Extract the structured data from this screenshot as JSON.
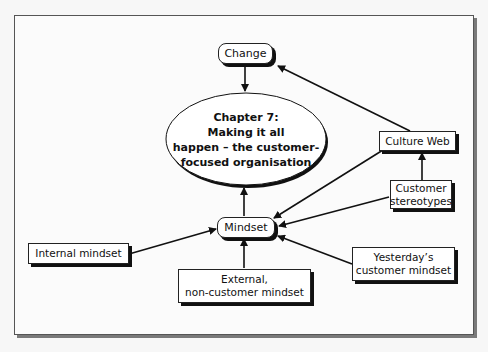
{
  "diagram": {
    "central_topic": {
      "lines": [
        "Chapter 7:",
        "Making it all",
        "happen – the customer-",
        "focused organisation"
      ]
    },
    "nodes": {
      "change": "Change",
      "mindset": "Mindset",
      "culture_web": "Culture Web",
      "customer_stereotypes": [
        "Customer",
        "stereotypes"
      ],
      "internal_mindset": "Internal mindset",
      "external_mindset": [
        "External,",
        "non-customer mindset"
      ],
      "yesterdays_mindset": [
        "Yesterday’s",
        "customer mindset"
      ]
    },
    "edges": [
      {
        "from": "Change",
        "to": "Chapter 7"
      },
      {
        "from": "Culture Web",
        "to": "Change"
      },
      {
        "from": "Mindset",
        "to": "Chapter 7"
      },
      {
        "from": "Customer stereotypes",
        "to": "Culture Web"
      },
      {
        "from": "Culture Web",
        "to": "Mindset"
      },
      {
        "from": "Customer stereotypes",
        "to": "Mindset"
      },
      {
        "from": "Internal mindset",
        "to": "Mindset"
      },
      {
        "from": "External, non-customer mindset",
        "to": "Mindset"
      },
      {
        "from": "Yesterday’s customer mindset",
        "to": "Mindset"
      }
    ],
    "colors": {
      "line": "#111111",
      "node_fill": "#ffffff",
      "background": "#fbfbfb"
    }
  }
}
